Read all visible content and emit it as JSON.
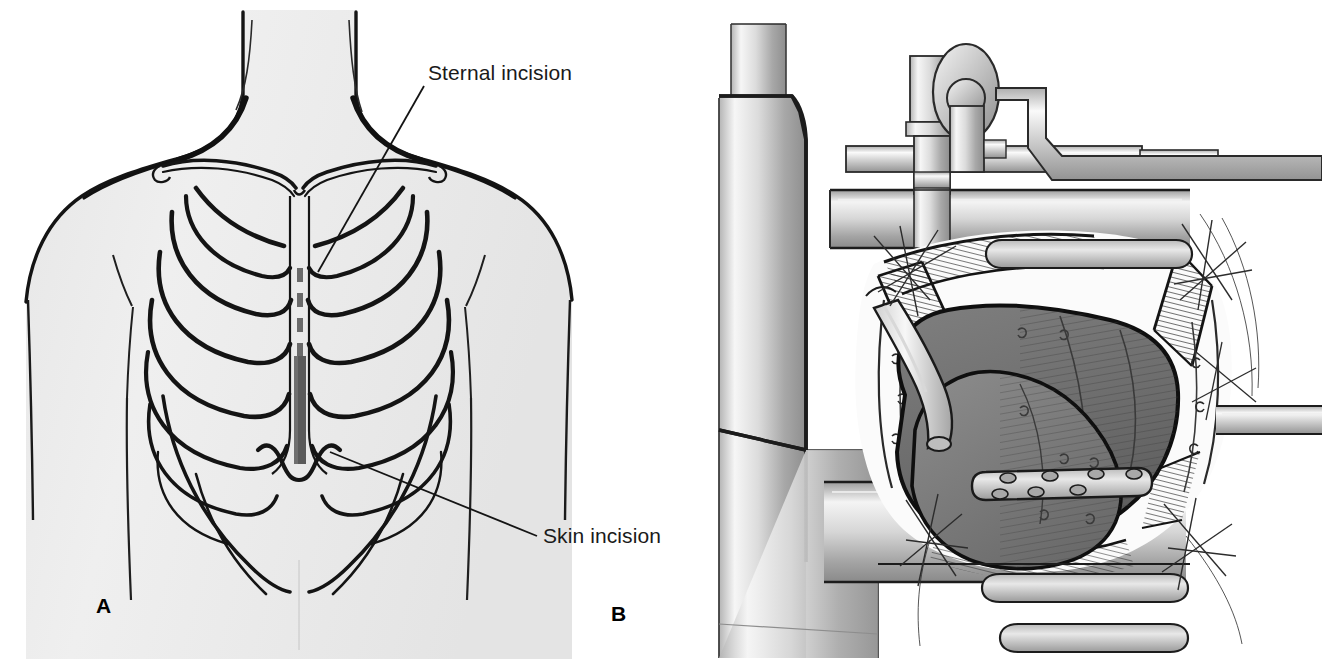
{
  "figure": {
    "background_color": "#ffffff",
    "width": 1322,
    "height": 659
  },
  "palette": {
    "ink": "#141414",
    "skin_fill": "#ececec",
    "skin_fill_edge": "#e3e3e3",
    "incision_bar": "#5a5a5a",
    "dashed_line": "#6a6a6a",
    "metal_light": "#f2f2f2",
    "metal_mid": "#c9c9c9",
    "metal_dark": "#8f8f8f",
    "metal_edge": "#2a2a2a",
    "organ_dark": "#6d6d6d",
    "organ_mid": "#7b7b7b",
    "organ_light": "#8e8e8e",
    "tissue_fill": "#f4f4f4",
    "suture_line": "#3a3a3a"
  },
  "panels": [
    {
      "id": "panel-a",
      "letter": "A",
      "letter_x": 96,
      "letter_y": 613,
      "caption": "Anterior chest with rib cage showing planned median sternotomy",
      "labels": [
        {
          "id": "sternal-incision",
          "text": "Sternal incision",
          "text_x": 428,
          "text_y": 80,
          "leader": "M 424 86 L 318 272"
        },
        {
          "id": "skin-incision",
          "text": "Skin incision",
          "text_x": 543,
          "text_y": 543,
          "leader": "M 537 536 L 330 452"
        }
      ]
    },
    {
      "id": "panel-b",
      "letter": "B",
      "letter_x": 611,
      "letter_y": 621,
      "caption": "Open sternotomy wound held by a self-retaining retractor exposing the thymus/heart with a perforated drain and suction tip",
      "labels": []
    }
  ],
  "panel_a_content": {
    "body_outline_description": "Head, neck, shoulders and upper torso seen from the front",
    "clavicles": 2,
    "rib_pairs": 7,
    "sternum": "midline",
    "incision_marker": {
      "dashed_upper_segment": true,
      "solid_bar_lower_segment": true,
      "bar_color": "#5a5a5a",
      "bar_x": 310,
      "bar_top": 358,
      "bar_bottom": 462,
      "bar_width": 11
    }
  },
  "panel_b_content": {
    "instruments": [
      "vertical-support-post",
      "horizontal-cross-bar",
      "crank-handle-knob",
      "upper-retractor-blade",
      "lower-retractor-blade",
      "right-side-rod",
      "suction-tip"
    ],
    "tissue_features": [
      "cut-sternal-edges-with-hatching",
      "retraction-sutures",
      "pericardial-edges"
    ],
    "organ": {
      "name": "heart-and-thymus",
      "shading": "hatched",
      "fill": "#6d6d6d"
    },
    "drain": {
      "name": "perforated-drain-tube",
      "hole_count": 7
    }
  }
}
